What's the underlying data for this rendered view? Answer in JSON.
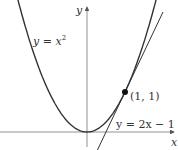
{
  "figure": {
    "type": "function-graph",
    "axes": {
      "x_label": "x",
      "y_label": "y"
    },
    "curves": [
      {
        "name": "parabola",
        "label_base": "y = x",
        "label_exp": "2",
        "equation": "y = x^2"
      },
      {
        "name": "tangent-line",
        "label": "y = 2x − 1",
        "equation": "y = 2x - 1"
      }
    ],
    "point": {
      "label": "(1, 1)",
      "x": 1,
      "y": 1
    },
    "colors": {
      "curve": "#333333",
      "axis": "#555555"
    }
  }
}
